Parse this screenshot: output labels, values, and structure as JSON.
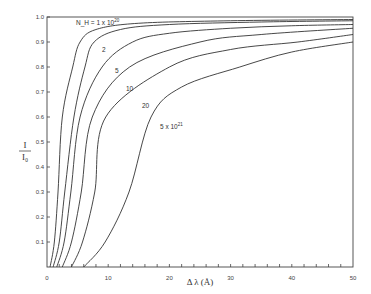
{
  "chart_data": {
    "type": "line",
    "title": "",
    "xlabel": "Δ λ (Å)",
    "ylabel": "I / I₀",
    "xlim": [
      0,
      50
    ],
    "ylim": [
      0,
      1.0
    ],
    "grid": false,
    "x_ticks": [
      "0",
      "10",
      "20",
      "30",
      "40",
      "50"
    ],
    "y_ticks": [
      "0.1",
      "0.2",
      "0.3",
      "0.4",
      "0.5",
      "0.6",
      "0.7",
      "0.8",
      "0.9",
      "1.0"
    ],
    "origin_label": "0",
    "series": [
      {
        "name": "N_H = 1 x 10^20",
        "label": "N_H = 1 x 10",
        "label_sup": "20",
        "points": [
          [
            0.5,
            0
          ],
          [
            1.2,
            0.1
          ],
          [
            1.8,
            0.3
          ],
          [
            2.5,
            0.6
          ],
          [
            4.2,
            0.8
          ],
          [
            5.4,
            0.9
          ],
          [
            8,
            0.95
          ],
          [
            15,
            0.975
          ],
          [
            30,
            0.985
          ],
          [
            50,
            0.99
          ]
        ]
      },
      {
        "name": "2 x 10^20",
        "label": "2",
        "points": [
          [
            1,
            0
          ],
          [
            2,
            0.1
          ],
          [
            2.9,
            0.3
          ],
          [
            4.4,
            0.6
          ],
          [
            6.2,
            0.8
          ],
          [
            7.7,
            0.9
          ],
          [
            12,
            0.95
          ],
          [
            20,
            0.97
          ],
          [
            35,
            0.98
          ],
          [
            50,
            0.985
          ]
        ]
      },
      {
        "name": "5 x 10^20",
        "label": "5",
        "points": [
          [
            1.6,
            0
          ],
          [
            2.8,
            0.1
          ],
          [
            3.9,
            0.3
          ],
          [
            5.4,
            0.6
          ],
          [
            9,
            0.8
          ],
          [
            14,
            0.9
          ],
          [
            20,
            0.935
          ],
          [
            30,
            0.955
          ],
          [
            40,
            0.965
          ],
          [
            50,
            0.97
          ]
        ]
      },
      {
        "name": "10 x 10^20",
        "label": "10",
        "points": [
          [
            2.5,
            0
          ],
          [
            4,
            0.1
          ],
          [
            5.6,
            0.3
          ],
          [
            7.4,
            0.6
          ],
          [
            13.5,
            0.8
          ],
          [
            25,
            0.9
          ],
          [
            35,
            0.93
          ],
          [
            50,
            0.955
          ]
        ]
      },
      {
        "name": "20 x 10^20",
        "label": "20",
        "points": [
          [
            4,
            0
          ],
          [
            5.8,
            0.1
          ],
          [
            7.8,
            0.3
          ],
          [
            9.6,
            0.6
          ],
          [
            20,
            0.8
          ],
          [
            30,
            0.87
          ],
          [
            41,
            0.9
          ],
          [
            50,
            0.93
          ]
        ]
      },
      {
        "name": "5 x 10^21",
        "label": "5 x 10",
        "label_sup": "21",
        "points": [
          [
            6,
            0
          ],
          [
            9.5,
            0.1
          ],
          [
            13.4,
            0.3
          ],
          [
            17,
            0.6
          ],
          [
            22,
            0.72
          ],
          [
            31.5,
            0.8
          ],
          [
            40,
            0.86
          ],
          [
            50,
            0.9
          ]
        ]
      }
    ]
  }
}
